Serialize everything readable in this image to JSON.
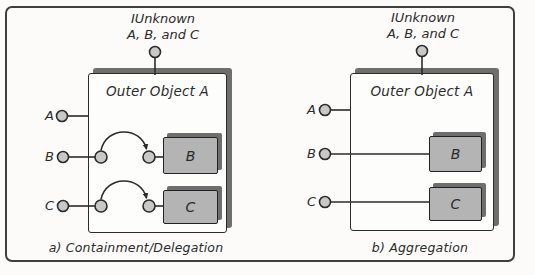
{
  "colors": {
    "line": "#2b2b2b",
    "circle_fill": "#c8c8c8",
    "inner_box_fill": "#b4b4b4",
    "shadow": "#6e6e6e",
    "frame_border": "#3f3f3f",
    "outer_box_fill": "#fdfdfc"
  },
  "panels": {
    "a": {
      "top_interface": {
        "line1": "IUnknown",
        "line2": "A, B, and C"
      },
      "outer_box_label": "Outer Object A",
      "interface_labels": {
        "a": "A",
        "b": "B",
        "c": "C"
      },
      "inner_boxes": {
        "b": "B",
        "c": "C"
      },
      "caption": "a) Containment/Delegation"
    },
    "b": {
      "top_interface": {
        "line1": "IUnknown",
        "line2": "A, B, and C"
      },
      "outer_box_label": "Outer Object A",
      "interface_labels": {
        "a": "A",
        "b": "B",
        "c": "C"
      },
      "inner_boxes": {
        "b": "B",
        "c": "C"
      },
      "caption": "b) Aggregation"
    }
  }
}
